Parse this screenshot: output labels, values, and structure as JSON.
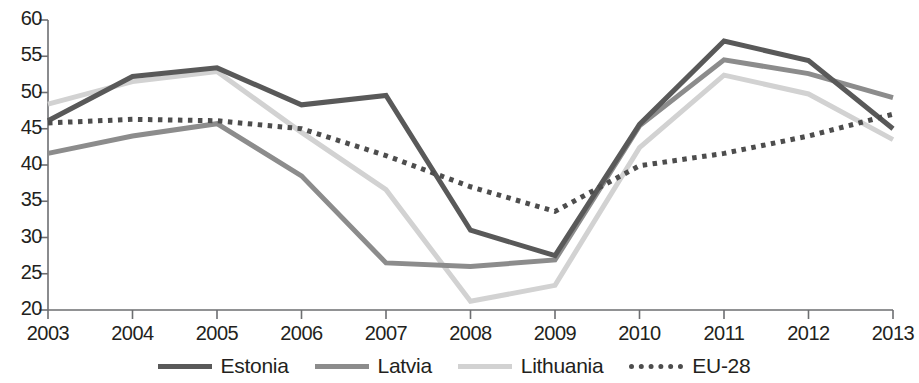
{
  "chart_data": {
    "type": "line",
    "title": "",
    "subtitle": "",
    "xlabel": "",
    "ylabel": "",
    "categories": [
      "2003",
      "2004",
      "2005",
      "2006",
      "2007",
      "2008",
      "2009",
      "2010",
      "2011",
      "2012",
      "2013"
    ],
    "x": [
      2003,
      2004,
      2005,
      2006,
      2007,
      2008,
      2009,
      2010,
      2011,
      2012,
      2013
    ],
    "xlim": [
      2003,
      2013
    ],
    "ylim": [
      20,
      60
    ],
    "ytick_labels": [
      "20",
      "25",
      "30",
      "35",
      "40",
      "45",
      "50",
      "55",
      "60"
    ],
    "ytick_values": [
      20,
      25,
      30,
      35,
      40,
      45,
      50,
      55,
      60
    ],
    "grid": false,
    "legend_position": "bottom",
    "series": [
      {
        "name": "Estonia",
        "color": "#595959",
        "style": "solid",
        "width": 5,
        "values": [
          46.1,
          52.2,
          53.4,
          48.3,
          49.6,
          31.0,
          27.5,
          45.6,
          57.1,
          54.4,
          45.0
        ]
      },
      {
        "name": "Latvia",
        "color": "#8c8c8c",
        "style": "solid",
        "width": 5,
        "values": [
          41.6,
          44.0,
          45.7,
          38.5,
          26.5,
          26.0,
          26.9,
          45.4,
          54.5,
          52.6,
          49.3
        ]
      },
      {
        "name": "Lithuania",
        "color": "#d2d2d2",
        "style": "solid",
        "width": 5,
        "values": [
          48.4,
          51.5,
          52.9,
          44.5,
          36.6,
          21.2,
          23.4,
          42.4,
          52.4,
          49.8,
          43.5
        ]
      },
      {
        "name": "EU-28",
        "color": "#4d4d4d",
        "style": "dotted",
        "width": 5,
        "values": [
          45.8,
          46.3,
          46.1,
          45.0,
          41.3,
          37.0,
          33.6,
          39.9,
          41.6,
          44.0,
          47.0
        ]
      }
    ]
  },
  "legend": {
    "items": [
      {
        "label": "Estonia"
      },
      {
        "label": "Latvia"
      },
      {
        "label": "Lithuania"
      },
      {
        "label": "EU-28"
      }
    ]
  }
}
